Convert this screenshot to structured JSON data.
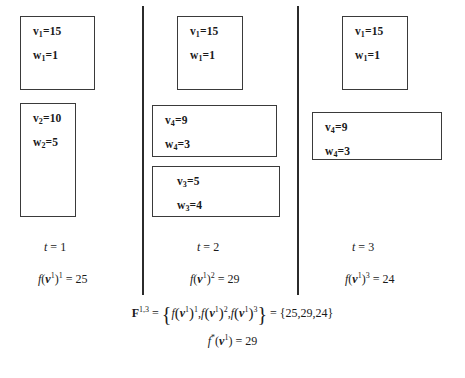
{
  "figure": {
    "line_color": "#2b2b2b",
    "box_border_color": "#3a3a3a",
    "background": "#ffffff"
  },
  "columns": [
    {
      "id": "t1",
      "time_label_prefix": "t",
      "time_label_value": "1",
      "objective_prefix": "f",
      "objective_var": "v",
      "objective_var_sup": "1",
      "objective_exp": "1",
      "objective_value": "25",
      "items": [
        {
          "value_label": "v",
          "value_sub": "1",
          "value": "15",
          "weight_label": "w",
          "weight_sub": "1",
          "weight": "1"
        },
        {
          "value_label": "v",
          "value_sub": "2",
          "value": "10",
          "weight_label": "w",
          "weight_sub": "2",
          "weight": "5"
        }
      ]
    },
    {
      "id": "t2",
      "time_label_prefix": "t",
      "time_label_value": "2",
      "objective_prefix": "f",
      "objective_var": "v",
      "objective_var_sup": "1",
      "objective_exp": "2",
      "objective_value": "29",
      "items": [
        {
          "value_label": "v",
          "value_sub": "1",
          "value": "15",
          "weight_label": "w",
          "weight_sub": "1",
          "weight": "1"
        },
        {
          "value_label": "v",
          "value_sub": "4",
          "value": "9",
          "weight_label": "w",
          "weight_sub": "4",
          "weight": "3"
        },
        {
          "value_label": "v",
          "value_sub": "3",
          "value": "5",
          "weight_label": "w",
          "weight_sub": "3",
          "weight": "4"
        }
      ]
    },
    {
      "id": "t3",
      "time_label_prefix": "t",
      "time_label_value": "3",
      "objective_prefix": "f",
      "objective_var": "v",
      "objective_var_sup": "1",
      "objective_exp": "3",
      "objective_value": "24",
      "items": [
        {
          "value_label": "v",
          "value_sub": "1",
          "value": "15",
          "weight_label": "w",
          "weight_sub": "1",
          "weight": "1"
        },
        {
          "value_label": "v",
          "value_sub": "4",
          "value": "9",
          "weight_label": "w",
          "weight_sub": "4",
          "weight": "3"
        }
      ]
    }
  ],
  "summary": {
    "set_symbol": "F",
    "set_superscript": "1,3",
    "equals": "=",
    "members": [
      {
        "fn": "f",
        "var": "v",
        "var_sup": "1",
        "exp": "1"
      },
      {
        "fn": "f",
        "var": "v",
        "var_sup": "1",
        "exp": "2"
      },
      {
        "fn": "f",
        "var": "v",
        "var_sup": "1",
        "exp": "3"
      }
    ],
    "result_set": "{25,29,24}",
    "best_fn": "f",
    "best_star": "*",
    "best_var": "v",
    "best_var_sup": "1",
    "best_value": "29"
  }
}
